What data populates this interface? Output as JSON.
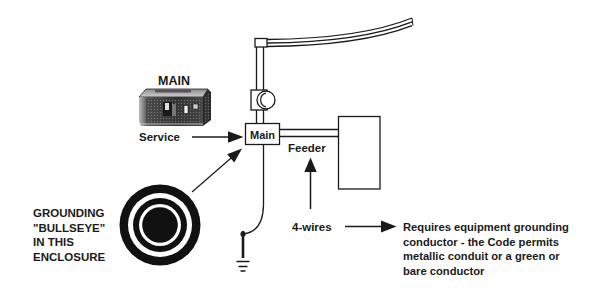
{
  "diagram": {
    "main_device_label": "MAIN",
    "service_label": "Service",
    "main_box_label": "Main",
    "feeder_label": "Feeder",
    "four_wires_label": "4-wires",
    "bullseye_lines": [
      "GROUNDING",
      "\"BULLSEYE\"",
      "IN THIS",
      "ENCLOSURE"
    ],
    "requirement_lines": [
      "Requires equipment grounding",
      "conductor - the Code permits",
      "metallic conduit or a green or",
      "bare conductor"
    ]
  },
  "colors": {
    "ink": "#1a1a1a",
    "background": "#ffffff"
  }
}
